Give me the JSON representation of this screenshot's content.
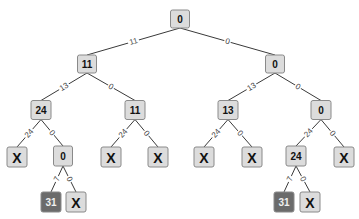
{
  "diagram": {
    "type": "tree",
    "colors": {
      "node_fill": "#dcdcdc",
      "node_border": "#8a8a8a",
      "node_text": "#111111",
      "highlight_fill": "#6b6b6b",
      "highlight_text": "#f0f0f0",
      "edge": "#3a3a3a",
      "edge_label": "#444444"
    },
    "nodes": [
      {
        "id": "n0",
        "label": "0",
        "cx": 180,
        "cy": 19,
        "w": 19,
        "h": 18,
        "fs": 10
      },
      {
        "id": "n1",
        "label": "11",
        "cx": 87,
        "cy": 64,
        "w": 19,
        "h": 18,
        "fs": 10
      },
      {
        "id": "n2",
        "label": "0",
        "cx": 275,
        "cy": 64,
        "w": 19,
        "h": 18,
        "fs": 10
      },
      {
        "id": "n3",
        "label": "24",
        "cx": 41,
        "cy": 110,
        "w": 20,
        "h": 19,
        "fs": 10
      },
      {
        "id": "n4",
        "label": "11",
        "cx": 135,
        "cy": 110,
        "w": 20,
        "h": 19,
        "fs": 10
      },
      {
        "id": "n5",
        "label": "13",
        "cx": 228,
        "cy": 110,
        "w": 20,
        "h": 19,
        "fs": 10
      },
      {
        "id": "n6",
        "label": "0",
        "cx": 321,
        "cy": 110,
        "w": 20,
        "h": 19,
        "fs": 10
      },
      {
        "id": "n7",
        "label": "X",
        "cx": 17,
        "cy": 157,
        "w": 20,
        "h": 20,
        "fs": 14
      },
      {
        "id": "n8",
        "label": "0",
        "cx": 63,
        "cy": 156,
        "w": 19,
        "h": 20,
        "fs": 10
      },
      {
        "id": "n9",
        "label": "X",
        "cx": 111,
        "cy": 157,
        "w": 20,
        "h": 20,
        "fs": 14
      },
      {
        "id": "n10",
        "label": "X",
        "cx": 158,
        "cy": 157,
        "w": 20,
        "h": 20,
        "fs": 14
      },
      {
        "id": "n11",
        "label": "X",
        "cx": 204,
        "cy": 157,
        "w": 20,
        "h": 20,
        "fs": 14
      },
      {
        "id": "n12",
        "label": "X",
        "cx": 252,
        "cy": 157,
        "w": 20,
        "h": 20,
        "fs": 14
      },
      {
        "id": "n13",
        "label": "24",
        "cx": 296,
        "cy": 156,
        "w": 20,
        "h": 20,
        "fs": 10
      },
      {
        "id": "n14",
        "label": "X",
        "cx": 344,
        "cy": 157,
        "w": 20,
        "h": 20,
        "fs": 14
      },
      {
        "id": "n15",
        "label": "31",
        "cx": 51,
        "cy": 202,
        "w": 20,
        "h": 20,
        "fs": 10,
        "highlight": true
      },
      {
        "id": "n16",
        "label": "X",
        "cx": 76,
        "cy": 202,
        "w": 20,
        "h": 20,
        "fs": 14
      },
      {
        "id": "n17",
        "label": "31",
        "cx": 284,
        "cy": 202,
        "w": 20,
        "h": 20,
        "fs": 10,
        "highlight": true
      },
      {
        "id": "n18",
        "label": "X",
        "cx": 310,
        "cy": 202,
        "w": 20,
        "h": 20,
        "fs": 14
      }
    ],
    "edges": [
      {
        "from": "n0",
        "to": "n1",
        "label": "11"
      },
      {
        "from": "n0",
        "to": "n2",
        "label": "0"
      },
      {
        "from": "n1",
        "to": "n3",
        "label": "13"
      },
      {
        "from": "n1",
        "to": "n4",
        "label": "0"
      },
      {
        "from": "n2",
        "to": "n5",
        "label": "13"
      },
      {
        "from": "n2",
        "to": "n6",
        "label": "0"
      },
      {
        "from": "n3",
        "to": "n7",
        "label": "24"
      },
      {
        "from": "n3",
        "to": "n8",
        "label": "0"
      },
      {
        "from": "n4",
        "to": "n9",
        "label": "24"
      },
      {
        "from": "n4",
        "to": "n10",
        "label": "0"
      },
      {
        "from": "n5",
        "to": "n11",
        "label": "24"
      },
      {
        "from": "n5",
        "to": "n12",
        "label": "0"
      },
      {
        "from": "n6",
        "to": "n13",
        "label": "24"
      },
      {
        "from": "n6",
        "to": "n14",
        "label": "0"
      },
      {
        "from": "n8",
        "to": "n15",
        "label": "7"
      },
      {
        "from": "n8",
        "to": "n16",
        "label": "0"
      },
      {
        "from": "n13",
        "to": "n17",
        "label": "7"
      },
      {
        "from": "n13",
        "to": "n18",
        "label": "0"
      }
    ]
  }
}
